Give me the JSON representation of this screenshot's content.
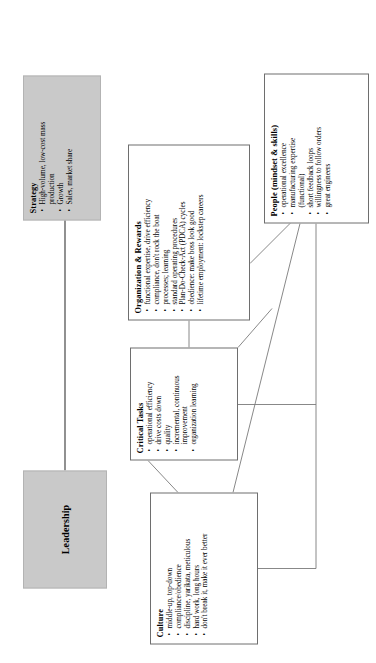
{
  "diagram": {
    "orientation": "rotated-90",
    "colors": {
      "shaded_box_fill": "#c9c9c9",
      "plain_box_fill": "#ffffff",
      "border": "#6e6e6e",
      "connector": "#7a7a7a",
      "arrow": "#555555"
    },
    "bullet_glyph": "•"
  },
  "boxes": {
    "leadership": {
      "title": "Leadership",
      "style": "shaded",
      "bullets": []
    },
    "strategy": {
      "title": "Strategy",
      "style": "shaded",
      "bullets": [
        "High-volume, low-cost mass",
        "production",
        "Growth",
        "Sales, market share"
      ],
      "bullet_flags": [
        true,
        false,
        true,
        true
      ]
    },
    "critical_tasks": {
      "title": "Critical Tasks",
      "style": "plain",
      "bullets": [
        "operational efficiency",
        "drive costs down",
        "quality",
        "incremental, continuous",
        "improvement",
        "organization learning"
      ],
      "bullet_flags": [
        true,
        true,
        true,
        true,
        false,
        true
      ]
    },
    "culture": {
      "title": "Culture",
      "style": "plain",
      "bullets": [
        "middle-up, top-down",
        "compliance/obedience",
        "discipline, yarikata, meticulous",
        "hard work, long hours",
        "don't break it, make it ever better"
      ],
      "bullet_flags": [
        true,
        true,
        true,
        true,
        true
      ]
    },
    "organization_rewards": {
      "title": "Organization & Rewards",
      "style": "plain",
      "bullets": [
        "functional expertise, drive efficiency",
        "compliance, don't rock the boat",
        "processes; learning",
        "standard operating procedures",
        "Plan-Do-Check-Act (PDCA) cycles",
        "obedience: make boss look good",
        "lifetime employment: lockstep careers"
      ],
      "bullet_flags": [
        true,
        true,
        true,
        true,
        true,
        true,
        true
      ]
    },
    "people": {
      "title": "People (mindset & skills)",
      "style": "plain",
      "bullets": [
        "operational excellence",
        "manufacturing expertise",
        "(functional)",
        "short feedback loops",
        "willingness to follow orders",
        "great engineers"
      ],
      "bullet_flags": [
        true,
        true,
        false,
        true,
        true,
        true
      ]
    }
  }
}
